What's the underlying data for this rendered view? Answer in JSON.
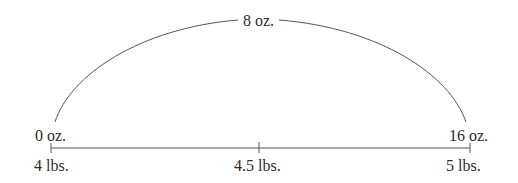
{
  "diagram": {
    "type": "number-line-with-arc",
    "arc": {
      "label": "8 oz.",
      "start_label": "0 oz.",
      "end_label": "16 oz."
    },
    "number_line": {
      "ticks": [
        {
          "label": "4 lbs.",
          "value": 4
        },
        {
          "label": "4.5 lbs.",
          "value": 4.5
        },
        {
          "label": "5 lbs.",
          "value": 5
        }
      ]
    },
    "colors": {
      "line": "#555555",
      "text": "#2b2b2b",
      "background": "#ffffff"
    }
  }
}
